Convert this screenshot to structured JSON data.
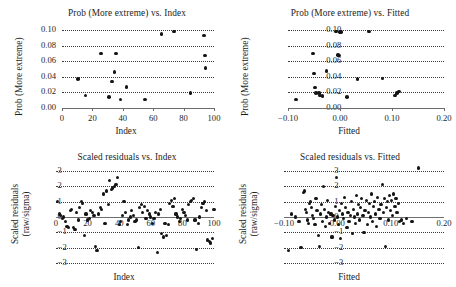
{
  "figure": {
    "background": "#ffffff",
    "point_color": "#141414",
    "grid_color": "#3a3a3a",
    "axis_color": "#6b6b6b"
  },
  "panels": [
    {
      "key": "prob_vs_index",
      "title": "Prob (More extreme) vs. Index",
      "xlabel": "Index",
      "ylabel": "Prob (More extreme)"
    },
    {
      "key": "prob_vs_fitted",
      "title": "Prob (More extreme) vs. Fitted",
      "xlabel": "Fitted",
      "ylabel": "Prob (More extreme)"
    },
    {
      "key": "resid_vs_index",
      "title": "Scaled residuals vs. Index",
      "xlabel": "Index",
      "ylabel_line1": "Scaled residuals",
      "ylabel_line2": "(raw/sigma)"
    },
    {
      "key": "resid_vs_fitted",
      "title": "Scaled residuals vs. Fitted",
      "xlabel": "Fitted",
      "ylabel_line1": "Scaled residuals",
      "ylabel_line2": "(raw/sigma)"
    }
  ],
  "chart_data": [
    {
      "type": "scatter",
      "title": "Prob (More extreme) vs. Index",
      "xlabel": "Index",
      "ylabel": "Prob (More extreme)",
      "xlim": [
        0,
        100
      ],
      "ylim": [
        0.0,
        0.105
      ],
      "xticks": [
        0,
        20,
        40,
        60,
        80,
        100
      ],
      "xticklabels": [
        "0",
        "20",
        "40",
        "60",
        "80",
        "100"
      ],
      "yticks": [
        0.0,
        0.02,
        0.04,
        0.06,
        0.08,
        0.1
      ],
      "yticklabels": [
        "0.00",
        "0.02",
        "0.04",
        "0.06",
        "0.08",
        "0.10"
      ],
      "grid": "horizontal-dotted",
      "legend": null,
      "x": [
        10.5,
        15.5,
        25.5,
        31.0,
        33.0,
        34.5,
        35.5,
        38.5,
        42.5,
        54.5,
        65.5,
        73.5,
        84.5,
        93.5,
        94.0,
        94.5
      ],
      "y": [
        0.037,
        0.016,
        0.07,
        0.014,
        0.034,
        0.046,
        0.07,
        0.011,
        0.027,
        0.011,
        0.095,
        0.098,
        0.019,
        0.093,
        0.067,
        0.051
      ]
    },
    {
      "type": "scatter",
      "title": "Prob (More extreme) vs. Fitted",
      "xlabel": "Fitted",
      "ylabel": "Prob (More extreme)",
      "xlim": [
        -0.1,
        0.2
      ],
      "ylim": [
        0.0,
        0.105
      ],
      "xticks": [
        -0.1,
        0.0,
        0.1,
        0.2
      ],
      "xticklabels": [
        "−0.10",
        "0.00",
        "0.10",
        "0.20"
      ],
      "yticks": [
        0.0,
        0.02,
        0.04,
        0.06,
        0.08,
        0.1
      ],
      "yticklabels": [
        "0.00",
        "0.02",
        "0.04",
        "0.06",
        "0.08",
        "0.10"
      ],
      "grid": "horizontal-dotted",
      "legend": null,
      "x": [
        -0.085,
        -0.052,
        -0.05,
        -0.048,
        -0.046,
        -0.04,
        -0.038,
        -0.034,
        -0.026,
        -0.008,
        -0.004,
        -0.002,
        0.0,
        0.002,
        0.014,
        0.034,
        0.056,
        0.082,
        0.106,
        0.11,
        0.113
      ],
      "y": [
        0.011,
        0.07,
        0.044,
        0.026,
        0.019,
        0.019,
        0.016,
        0.015,
        0.047,
        0.098,
        0.068,
        0.067,
        0.097,
        0.097,
        0.014,
        0.037,
        0.098,
        0.038,
        0.016,
        0.019,
        0.021
      ]
    },
    {
      "type": "scatter",
      "title": "Scaled residuals vs. Index",
      "xlabel": "Index",
      "ylabel": "Scaled residuals (raw/sigma)",
      "xlim": [
        0,
        100
      ],
      "ylim": [
        -3.2,
        3.2
      ],
      "xticks": [
        0,
        20,
        40,
        60,
        80,
        100
      ],
      "xticklabels": [
        "0",
        "20",
        "40",
        "60",
        "80",
        "100"
      ],
      "yticks": [
        -3,
        -2,
        -1,
        0,
        1,
        2,
        3
      ],
      "yticklabels": [
        "−3",
        "−2",
        "−1",
        "0",
        "1",
        "2",
        "3"
      ],
      "grid": "horizontal-dotted",
      "zeroline": true,
      "legend": null,
      "x": [
        1,
        2,
        3,
        4,
        5,
        6,
        7,
        8,
        9,
        10,
        11,
        12,
        13,
        14,
        15,
        16,
        17,
        18,
        19,
        20,
        21,
        22,
        23,
        24,
        25,
        26,
        27,
        28,
        29,
        30,
        31,
        32,
        33,
        34,
        35,
        36,
        37,
        38,
        39,
        40,
        41,
        42,
        43,
        44,
        45,
        46,
        47,
        48,
        49,
        50,
        51,
        52,
        53,
        54,
        55,
        56,
        57,
        58,
        59,
        60,
        61,
        62,
        63,
        64,
        65,
        66,
        67,
        68,
        69,
        70,
        71,
        72,
        73,
        74,
        75,
        76,
        77,
        78,
        79,
        80,
        81,
        82,
        83,
        84,
        85,
        86,
        87,
        88,
        89,
        90,
        91,
        92,
        93,
        94,
        95,
        96,
        97,
        98,
        99,
        100
      ],
      "y": [
        1.0,
        0.2,
        0.1,
        -0.1,
        0.0,
        -0.3,
        -0.6,
        -0.7,
        0.4,
        0.5,
        -0.7,
        -0.8,
        0.3,
        -0.2,
        0.6,
        1.0,
        0.9,
        -1.2,
        0.2,
        -0.2,
        -0.1,
        0.4,
        0.3,
        0.1,
        -1.9,
        -2.2,
        0.2,
        0.6,
        0.5,
        1.5,
        -0.4,
        1.7,
        0.8,
        2.4,
        1.8,
        1.9,
        2.0,
        2.1,
        2.6,
        -0.5,
        -0.3,
        0.1,
        1.0,
        0.3,
        -0.5,
        -0.2,
        0.0,
        0.4,
        0.1,
        -0.3,
        -0.2,
        -2.0,
        0.6,
        0.8,
        0.3,
        0.7,
        -0.1,
        0.4,
        0.2,
        0.0,
        -0.4,
        -0.1,
        0.3,
        -2.3,
        0.2,
        0.5,
        -1.1,
        -1.3,
        -0.4,
        -1.2,
        -0.5,
        0.9,
        1.1,
        0.7,
        1.2,
        0.2,
        0.0,
        -0.3,
        -0.1,
        0.5,
        0.3,
        0.1,
        -0.2,
        0.8,
        1.0,
        1.1,
        1.2,
        -0.2,
        -2.1,
        -0.4,
        0.0,
        0.6,
        0.9,
        1.0,
        0.4,
        -1.5,
        -1.6,
        -1.7,
        -1.4,
        0.5,
        0.3
      ]
    },
    {
      "type": "scatter",
      "title": "Scaled residuals vs. Fitted",
      "xlabel": "Fitted",
      "ylabel": "Scaled residuals (raw/sigma)",
      "xlim": [
        -0.1,
        0.2
      ],
      "ylim": [
        -3.2,
        3.2
      ],
      "xticks": [
        -0.1,
        0.0,
        0.1,
        0.2
      ],
      "xticklabels": [
        "−0.10",
        "0.00",
        "0.10",
        "0.20"
      ],
      "yticks": [
        -3,
        -2,
        -1,
        0,
        1,
        2,
        3
      ],
      "yticklabels": [
        "−3",
        "−2",
        "−1",
        "0",
        "1",
        "2",
        "3"
      ],
      "grid": "horizontal-dotted",
      "zeroline": true,
      "legend": null,
      "x": [
        -0.092,
        -0.086,
        -0.078,
        -0.072,
        -0.068,
        -0.064,
        -0.062,
        -0.06,
        -0.058,
        -0.056,
        -0.054,
        -0.052,
        -0.05,
        -0.048,
        -0.046,
        -0.044,
        -0.042,
        -0.04,
        -0.038,
        -0.036,
        -0.034,
        -0.032,
        -0.03,
        -0.028,
        -0.026,
        -0.024,
        -0.022,
        -0.02,
        -0.018,
        -0.016,
        -0.014,
        -0.012,
        -0.01,
        -0.008,
        -0.006,
        -0.004,
        -0.002,
        0.0,
        0.002,
        0.004,
        0.006,
        0.008,
        0.01,
        0.012,
        0.014,
        0.016,
        0.018,
        0.02,
        0.022,
        0.024,
        0.026,
        0.028,
        0.03,
        0.032,
        0.034,
        0.036,
        0.038,
        0.04,
        0.042,
        0.044,
        0.046,
        0.048,
        0.05,
        0.052,
        0.054,
        0.056,
        0.058,
        0.06,
        0.062,
        0.064,
        0.066,
        0.068,
        0.07,
        0.072,
        0.074,
        0.076,
        0.078,
        0.08,
        0.082,
        0.084,
        0.086,
        0.088,
        0.09,
        0.092,
        0.094,
        0.096,
        0.098,
        0.1,
        0.102,
        0.104,
        0.106,
        0.108,
        0.11,
        0.112,
        0.114,
        0.116,
        0.12,
        0.124,
        0.13,
        0.14,
        0.152
      ],
      "y": [
        -2.2,
        0.2,
        0.0,
        -0.3,
        -2.0,
        1.6,
        1.7,
        0.5,
        0.3,
        -0.2,
        -0.4,
        0.9,
        1.0,
        0.6,
        0.1,
        -0.1,
        -0.5,
        1.2,
        0.4,
        -1.2,
        -1.9,
        0.2,
        0.8,
        -0.3,
        2.0,
        0.5,
        -0.6,
        0.0,
        1.1,
        0.3,
        -0.4,
        0.2,
        -1.3,
        0.1,
        -0.2,
        0.7,
        2.6,
        0.0,
        -0.5,
        0.4,
        -1.4,
        0.9,
        0.2,
        -0.1,
        1.3,
        0.6,
        -0.7,
        0.3,
        -0.3,
        0.1,
        1.0,
        -1.1,
        0.5,
        0.0,
        -0.4,
        1.4,
        0.2,
        0.8,
        -0.2,
        0.6,
        1.2,
        0.1,
        -1.0,
        0.4,
        1.1,
        -0.5,
        0.3,
        0.9,
        0.0,
        1.5,
        -0.3,
        0.7,
        1.0,
        0.2,
        -0.6,
        1.3,
        0.5,
        -0.1,
        0.8,
        2.1,
        0.3,
        1.2,
        -1.9,
        0.6,
        1.0,
        -0.2,
        1.4,
        0.4,
        1.1,
        0.1,
        1.5,
        0.7,
        1.2,
        0.3,
        0.9,
        -0.3,
        -0.2,
        -0.4,
        -0.1,
        -0.3
      ]
    }
  ]
}
